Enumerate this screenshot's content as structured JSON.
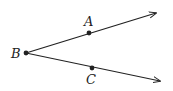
{
  "diagram": {
    "type": "angle-rays",
    "stroke_color": "#222222",
    "vertex": {
      "label": "B",
      "x": 26,
      "y": 53,
      "label_x": 11,
      "label_y": 58
    },
    "rays": [
      {
        "name": "ray-BA",
        "end_x": 156,
        "end_y": 13,
        "point": {
          "label": "A",
          "x": 89,
          "y": 33,
          "label_x": 84,
          "label_y": 26
        }
      },
      {
        "name": "ray-BC",
        "end_x": 160,
        "end_y": 81,
        "point": {
          "label": "C",
          "x": 92,
          "y": 68,
          "label_x": 86,
          "label_y": 84
        }
      }
    ]
  }
}
